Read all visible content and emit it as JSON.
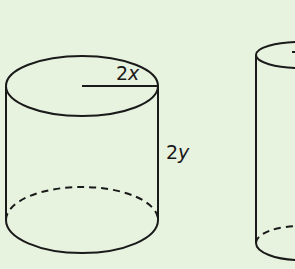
{
  "figure": {
    "background": "#e8f3df",
    "stroke": "#1a1a1a",
    "cylinders": [
      {
        "id": "cylinder-a",
        "radius_label": "2x",
        "radius_coef": "2",
        "radius_var": "x",
        "height_label": "2y",
        "height_coef": "2",
        "height_var": "y"
      },
      {
        "id": "cylinder-b",
        "note": "partially visible at right edge"
      }
    ]
  }
}
